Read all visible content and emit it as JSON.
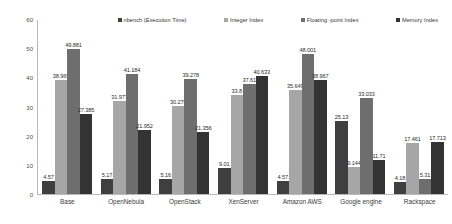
{
  "chart_data": {
    "type": "bar",
    "title": "",
    "xlabel": "",
    "ylabel": "",
    "ylim": [
      0,
      60
    ],
    "yticks": [
      0,
      10,
      20,
      30,
      40,
      50,
      60
    ],
    "grid": false,
    "legend_position": "top",
    "categories": [
      "Base",
      "OpenNebula",
      "OpenStack",
      "XenServer",
      "Amazon AWS",
      "Google engine",
      "Rackspace"
    ],
    "series": [
      {
        "name": "nbench (Execution Time)",
        "color": "#3f3f3f",
        "values": [
          4.57,
          5.17,
          5.16,
          9.01,
          4.57,
          25.13,
          4.18
        ],
        "labels": [
          "4.57",
          "5.17",
          "5.16",
          "9.01",
          "4.57",
          "25.13",
          "4.18"
        ]
      },
      {
        "name": "Integer Index",
        "color": "#a6a6a6",
        "values": [
          38.969,
          31.977,
          30.275,
          33.8,
          35.649,
          9.144,
          17.461
        ],
        "labels": [
          "38.969",
          "31.977",
          "30.275",
          "33.8",
          "35.649",
          "9.144",
          "17.461"
        ]
      },
      {
        "name": "Floating -point Index",
        "color": "#6e6e6e",
        "values": [
          49.881,
          41.184,
          39.278,
          37.61,
          48.001,
          33.033,
          5.31
        ],
        "labels": [
          "49.881",
          "41.184",
          "39.278",
          "37.61",
          "48.001",
          "33.033",
          "5.31"
        ]
      },
      {
        "name": "Memory Index",
        "color": "#333333",
        "values": [
          27.385,
          21.952,
          21.356,
          40.633,
          38.967,
          11.71,
          17.713
        ],
        "labels": [
          "27.385",
          "21.952",
          "21.356",
          "40.633",
          "38.967",
          "11.71",
          "17.713"
        ]
      }
    ]
  }
}
